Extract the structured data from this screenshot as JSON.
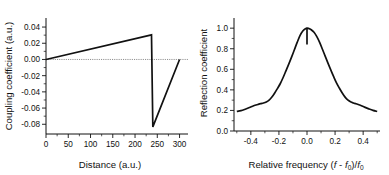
{
  "figure": {
    "background_color": "#ffffff",
    "line_color": "#111111",
    "zeroline_color": "#6e6e6e"
  },
  "chart_data": [
    {
      "type": "line",
      "panel": "left",
      "title": "",
      "xlabel": "Distance (a.u.)",
      "ylabel": "Coupling coefficient (a.u.)",
      "xlim": [
        0,
        310
      ],
      "ylim": [
        -0.092,
        0.045
      ],
      "xticks": [
        0,
        50,
        100,
        150,
        200,
        250,
        300
      ],
      "xtick_labels": [
        "0",
        "50",
        "100",
        "150",
        "200",
        "250",
        "300"
      ],
      "yticks": [
        0.04,
        0.02,
        0.0,
        -0.02,
        -0.04,
        -0.06,
        -0.08
      ],
      "ytick_labels": [
        "0.04",
        "0.02",
        "0.00",
        "-0.02",
        "-0.04",
        "-0.06",
        "-0.08"
      ],
      "grid": false,
      "legend": null,
      "annotations": [
        {
          "kind": "zero-reference-line",
          "y": 0.0,
          "style": "dotted",
          "x_from": 0,
          "x_to": 310
        }
      ],
      "series": [
        {
          "name": "coupling coefficient",
          "x": [
            0,
            237,
            240,
            300
          ],
          "y": [
            0.0,
            0.0303,
            -0.0832,
            0.0
          ]
        }
      ]
    },
    {
      "type": "line",
      "panel": "right",
      "title": "",
      "xlabel": "Relative frequency (f - f0)/f0",
      "xlabel_parts": {
        "prefix": "Relative frequency (",
        "f1": "f",
        "dash": " - ",
        "f2": "f",
        "sub1": "0",
        "mid": ")/",
        "f3": "f",
        "sub2": "0"
      },
      "ylabel": "Reflection coefficient",
      "xlim": [
        -0.52,
        0.52
      ],
      "ylim": [
        0.0,
        1.06
      ],
      "xticks": [
        -0.4,
        -0.2,
        0.0,
        0.2,
        0.4
      ],
      "xtick_labels": [
        "-0.4",
        "-0.2",
        "0.0",
        "0.2",
        "0.4"
      ],
      "yticks": [
        0.0,
        0.2,
        0.4,
        0.6,
        0.8,
        1.0
      ],
      "ytick_labels": [
        "0.0",
        "0.2",
        "0.4",
        "0.6",
        "0.8",
        "1.0"
      ],
      "grid": false,
      "legend": null,
      "annotations": [
        {
          "kind": "notch",
          "x": 0.0,
          "y_top": 1.0,
          "y_bottom": 0.84
        }
      ],
      "series": [
        {
          "name": "reflection coefficient",
          "x": [
            -0.5,
            -0.47,
            -0.44,
            -0.41,
            -0.38,
            -0.35,
            -0.33,
            -0.31,
            -0.29,
            -0.27,
            -0.25,
            -0.23,
            -0.21,
            -0.19,
            -0.17,
            -0.15,
            -0.13,
            -0.11,
            -0.09,
            -0.07,
            -0.05,
            -0.03,
            -0.01,
            0.0,
            0.01,
            0.03,
            0.05,
            0.07,
            0.09,
            0.11,
            0.13,
            0.15,
            0.17,
            0.19,
            0.21,
            0.23,
            0.25,
            0.27,
            0.29,
            0.31,
            0.33,
            0.35,
            0.38,
            0.41,
            0.44,
            0.47,
            0.5
          ],
          "y": [
            0.19,
            0.198,
            0.212,
            0.228,
            0.245,
            0.258,
            0.266,
            0.272,
            0.282,
            0.3,
            0.33,
            0.37,
            0.415,
            0.462,
            0.52,
            0.585,
            0.65,
            0.718,
            0.79,
            0.862,
            0.928,
            0.972,
            0.995,
            1.0,
            0.998,
            0.985,
            0.96,
            0.918,
            0.862,
            0.795,
            0.726,
            0.658,
            0.592,
            0.528,
            0.468,
            0.418,
            0.372,
            0.332,
            0.302,
            0.284,
            0.273,
            0.265,
            0.25,
            0.232,
            0.215,
            0.2,
            0.19
          ]
        }
      ]
    }
  ]
}
